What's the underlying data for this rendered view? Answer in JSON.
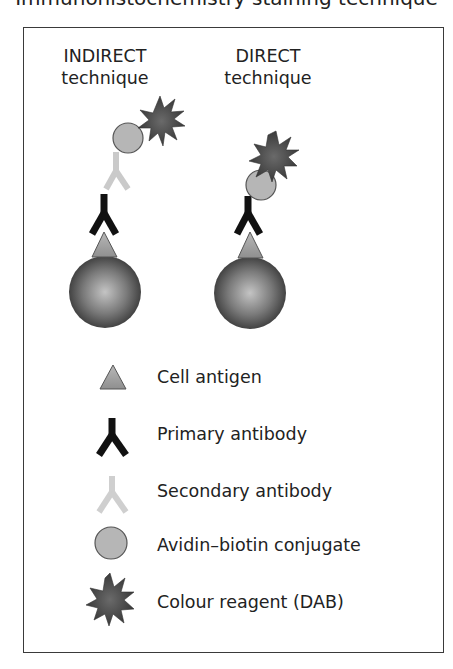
{
  "header": {
    "cutoff_text": "Immunohistochemistry staining technique"
  },
  "columns": [
    {
      "title_line1": "INDIRECT",
      "title_line2": "technique"
    },
    {
      "title_line1": "DIRECT",
      "title_line2": "technique"
    }
  ],
  "legend": {
    "items": [
      {
        "icon": "triangle-antigen-icon",
        "label": "Cell antigen"
      },
      {
        "icon": "black-y-antibody-icon",
        "label": "Primary antibody"
      },
      {
        "icon": "light-gray-y-antibody-icon",
        "label": "Secondary antibody"
      },
      {
        "icon": "gray-circle-icon",
        "label": "Avidin–biotin conjugate"
      },
      {
        "icon": "dark-starburst-icon",
        "label": "Colour reagent (DAB)"
      }
    ]
  },
  "colors": {
    "frame": "#3a3a3a",
    "primary_antibody": "#111111",
    "secondary_antibody": "#c8c8c8",
    "antigen_fill": "#a9a9a9",
    "conjugate_fill": "#b5b5b5",
    "reagent_fill": "#555555",
    "cell_dark": "#3c3c3c",
    "cell_light": "#bdbdbd"
  }
}
